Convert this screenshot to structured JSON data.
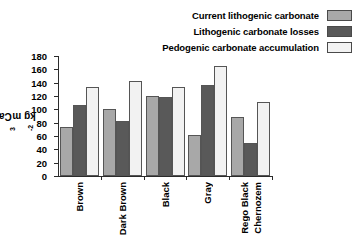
{
  "chart_data": {
    "type": "bar",
    "title": "",
    "subtitle": "",
    "xlabel": "",
    "ylabel": "Ca Co3 kg m-2",
    "ylabel_parts": {
      "prefix": "Ca Co",
      "sub": "3",
      "middle": " kg m",
      "sup": "-2"
    },
    "categories": [
      "Brown",
      "Dark Brown",
      "Black",
      "Gray",
      "Rego Black Chernozem"
    ],
    "category_lines": [
      [
        "Brown"
      ],
      [
        "Dark Brown"
      ],
      [
        "Black"
      ],
      [
        "Gray"
      ],
      [
        "Rego Black",
        "Chernozem"
      ]
    ],
    "series": [
      {
        "name": "Current lithogenic carbonate",
        "color": "#a8a8a8",
        "values": [
          73,
          100,
          120,
          62,
          88
        ]
      },
      {
        "name": "Lithogenic carbonate losses",
        "color": "#595959",
        "values": [
          107,
          82,
          119,
          136,
          50
        ]
      },
      {
        "name": "Pedogenic carbonate accumulation",
        "color": "#f2f2f2",
        "values": [
          133,
          143,
          134,
          165,
          111
        ]
      }
    ],
    "ylim": [
      0,
      180
    ],
    "yticks": [
      0,
      20,
      40,
      60,
      80,
      100,
      120,
      140,
      160,
      180
    ],
    "ytick_labels": [
      "0",
      "20",
      "40",
      "60",
      "80",
      "100",
      "120",
      "140",
      "160",
      "180"
    ],
    "grid": false,
    "legend_position": "top-right",
    "axis_color": "#2b2b2b",
    "background": "#ffffff"
  },
  "legend": {
    "items": [
      {
        "label": "Current lithogenic carbonate",
        "color": "#a8a8a8"
      },
      {
        "label": "Lithogenic carbonate losses",
        "color": "#595959"
      },
      {
        "label": "Pedogenic carbonate accumulation",
        "color": "#f2f2f2"
      }
    ]
  }
}
